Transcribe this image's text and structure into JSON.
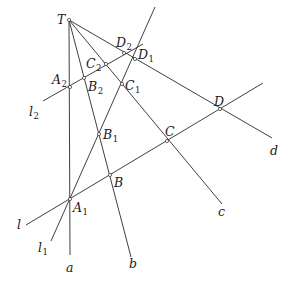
{
  "diagram": {
    "colors": {
      "background": "#ffffff",
      "line": "#2a2a2a",
      "text": "#1a1a1a"
    },
    "center": {
      "name": "T",
      "x": 69,
      "y": 20
    },
    "pencil_lines": [
      {
        "name": "a",
        "from": [
          69,
          20
        ],
        "to": [
          70,
          255
        ]
      },
      {
        "name": "b",
        "from": [
          69,
          20
        ],
        "to": [
          131,
          257
        ]
      },
      {
        "name": "c",
        "from": [
          69,
          20
        ],
        "to": [
          222,
          204
        ]
      },
      {
        "name": "d",
        "from": [
          69,
          20
        ],
        "to": [
          272,
          138
        ]
      }
    ],
    "transversals": [
      {
        "name": "l",
        "from": [
          26,
          225
        ],
        "to": [
          263,
          83
        ]
      },
      {
        "name": "l1",
        "from": [
          51,
          241
        ],
        "to": [
          155,
          7
        ]
      },
      {
        "name": "l2",
        "from": [
          43,
          101
        ],
        "to": [
          143,
          44
        ]
      }
    ],
    "points": [
      {
        "name": "T",
        "base": "T",
        "sub": "",
        "x": 69,
        "y": 20
      },
      {
        "name": "A1",
        "base": "A",
        "sub": "1",
        "x": 70,
        "y": 199
      },
      {
        "name": "A2",
        "base": "A",
        "sub": "2",
        "x": 70,
        "y": 87
      },
      {
        "name": "B",
        "base": "B",
        "sub": "",
        "x": 110,
        "y": 175
      },
      {
        "name": "B1",
        "base": "B",
        "sub": "1",
        "x": 99,
        "y": 134
      },
      {
        "name": "B2",
        "base": "B",
        "sub": "2",
        "x": 84,
        "y": 78
      },
      {
        "name": "C",
        "base": "C",
        "sub": "",
        "x": 167,
        "y": 141
      },
      {
        "name": "C1",
        "base": "C",
        "sub": "1",
        "x": 122,
        "y": 84
      },
      {
        "name": "C2",
        "base": "C",
        "sub": "2",
        "x": 106,
        "y": 64
      },
      {
        "name": "D",
        "base": "D",
        "sub": "",
        "x": 220,
        "y": 109
      },
      {
        "name": "D1",
        "base": "D",
        "sub": "1",
        "x": 135,
        "y": 59
      },
      {
        "name": "D2",
        "base": "D",
        "sub": "2",
        "x": 124,
        "y": 53
      }
    ],
    "labels": {
      "T": {
        "base": "T",
        "sub": "",
        "x": 57,
        "y": 24
      },
      "A1": {
        "base": "A",
        "sub": "1",
        "x": 73,
        "y": 212
      },
      "A2": {
        "base": "A",
        "sub": "2",
        "x": 52,
        "y": 84
      },
      "B": {
        "base": "B",
        "sub": "",
        "x": 114,
        "y": 187
      },
      "B1": {
        "base": "B",
        "sub": "1",
        "x": 103,
        "y": 139
      },
      "B2": {
        "base": "B",
        "sub": "2",
        "x": 88,
        "y": 91
      },
      "C": {
        "base": "C",
        "sub": "",
        "x": 165,
        "y": 136
      },
      "C1": {
        "base": "C",
        "sub": "1",
        "x": 125,
        "y": 90
      },
      "C2": {
        "base": "C",
        "sub": "2",
        "x": 86,
        "y": 68
      },
      "D": {
        "base": "D",
        "sub": "",
        "x": 214,
        "y": 106
      },
      "D1": {
        "base": "D",
        "sub": "1",
        "x": 138,
        "y": 59
      },
      "D2": {
        "base": "D",
        "sub": "2",
        "x": 116,
        "y": 47
      },
      "a": {
        "base": "a",
        "sub": "",
        "x": 66,
        "y": 272
      },
      "b": {
        "base": "b",
        "sub": "",
        "x": 129,
        "y": 268
      },
      "c": {
        "base": "c",
        "sub": "",
        "x": 218,
        "y": 216
      },
      "d": {
        "base": "d",
        "sub": "",
        "x": 270,
        "y": 155
      },
      "l": {
        "base": "l",
        "sub": "",
        "x": 17,
        "y": 229
      },
      "l1": {
        "base": "l",
        "sub": "1",
        "x": 38,
        "y": 252
      },
      "l2": {
        "base": "l",
        "sub": "2",
        "x": 29,
        "y": 116
      }
    }
  }
}
